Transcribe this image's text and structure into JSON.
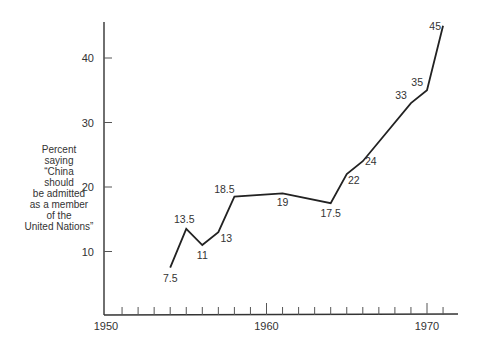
{
  "chart_data": {
    "type": "line",
    "title": "",
    "xlabel": "",
    "ylabel": "Percent saying \"China should be admitted as a member of the United Nations\"",
    "ylabel_lines": [
      "Percent",
      "saying",
      "“China",
      "should",
      "be admitted",
      "as a member",
      "of the",
      "United Nations”"
    ],
    "x": [
      1954,
      1955,
      1956,
      1957,
      1958,
      1961,
      1964,
      1965,
      1966,
      1969,
      1970,
      1971
    ],
    "series": [
      {
        "name": "Percent favoring admission of China to UN",
        "values": [
          7.5,
          13.5,
          11,
          13,
          18.5,
          19,
          17.5,
          22,
          24,
          33,
          35,
          45
        ],
        "labels": [
          "7.5",
          "13.5",
          "11",
          "13",
          "18.5",
          "19",
          "17.5",
          "22",
          "24",
          "33",
          "35",
          "45"
        ]
      }
    ],
    "xticks": [
      "1950",
      "1960",
      "1970"
    ],
    "yticks": [
      "10",
      "20",
      "30",
      "40"
    ],
    "xlim": [
      1950,
      1972
    ],
    "ylim": [
      0,
      46
    ],
    "grid": false,
    "legend": "none",
    "minor_xticks": "yearly"
  }
}
